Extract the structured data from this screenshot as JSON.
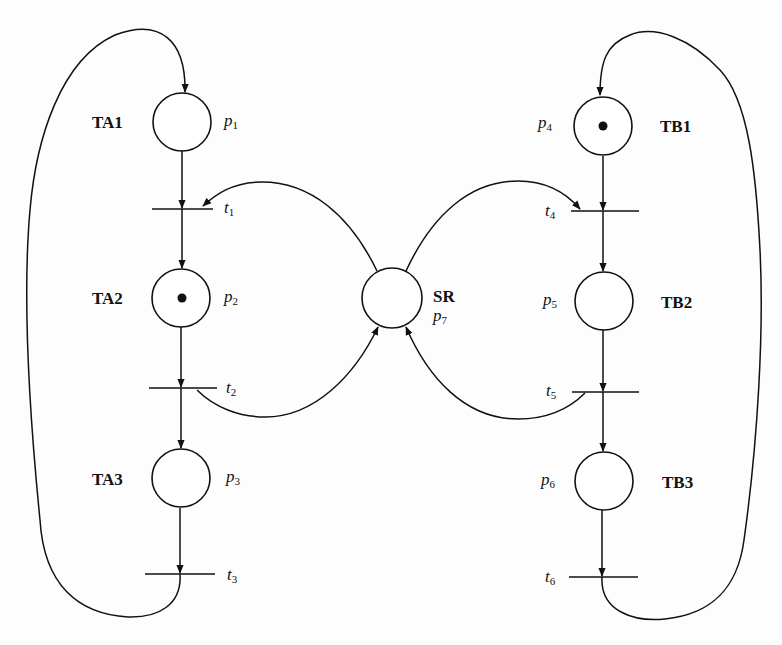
{
  "diagram": {
    "type": "petri-net",
    "colors": {
      "stroke": "#111111",
      "background": "#ffffff"
    },
    "places": [
      {
        "id": "p1",
        "base": "p",
        "sub": "1",
        "name": "TA1",
        "tokens": 0
      },
      {
        "id": "p2",
        "base": "p",
        "sub": "2",
        "name": "TA2",
        "tokens": 1
      },
      {
        "id": "p3",
        "base": "p",
        "sub": "3",
        "name": "TA3",
        "tokens": 0
      },
      {
        "id": "p4",
        "base": "p",
        "sub": "4",
        "name": "TB1",
        "tokens": 1
      },
      {
        "id": "p5",
        "base": "p",
        "sub": "5",
        "name": "TB2",
        "tokens": 0
      },
      {
        "id": "p6",
        "base": "p",
        "sub": "6",
        "name": "TB3",
        "tokens": 0
      },
      {
        "id": "p7",
        "base": "p",
        "sub": "7",
        "name": "SR",
        "tokens": 0
      }
    ],
    "transitions": [
      {
        "id": "t1",
        "base": "t",
        "sub": "1"
      },
      {
        "id": "t2",
        "base": "t",
        "sub": "2"
      },
      {
        "id": "t3",
        "base": "t",
        "sub": "3"
      },
      {
        "id": "t4",
        "base": "t",
        "sub": "4"
      },
      {
        "id": "t5",
        "base": "t",
        "sub": "5"
      },
      {
        "id": "t6",
        "base": "t",
        "sub": "6"
      }
    ],
    "arcs": [
      {
        "from": "p1",
        "to": "t1"
      },
      {
        "from": "t1",
        "to": "p2"
      },
      {
        "from": "p2",
        "to": "t2"
      },
      {
        "from": "t2",
        "to": "p3"
      },
      {
        "from": "p3",
        "to": "t3"
      },
      {
        "from": "t3",
        "to": "p1"
      },
      {
        "from": "p4",
        "to": "t4"
      },
      {
        "from": "t4",
        "to": "p5"
      },
      {
        "from": "p5",
        "to": "t5"
      },
      {
        "from": "t5",
        "to": "p6"
      },
      {
        "from": "p6",
        "to": "t6"
      },
      {
        "from": "t6",
        "to": "p4"
      },
      {
        "from": "p7",
        "to": "t1"
      },
      {
        "from": "t2",
        "to": "p7"
      },
      {
        "from": "p7",
        "to": "t4"
      },
      {
        "from": "t5",
        "to": "p7"
      }
    ]
  }
}
